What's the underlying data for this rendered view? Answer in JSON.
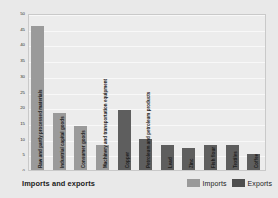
{
  "chart_data": {
    "type": "bar",
    "title": "Imports and exports",
    "xlabel": "",
    "ylabel": "Percentage of total",
    "ylim": [
      0,
      50
    ],
    "ytick_labels": [
      "50",
      "45",
      "40",
      "35",
      "30",
      "25",
      "20",
      "15",
      "10",
      "5",
      "0"
    ],
    "ytick_values": [
      50,
      45,
      40,
      35,
      30,
      25,
      20,
      15,
      10,
      5,
      0
    ],
    "grid": true,
    "legend_position": "bottom-right",
    "categories": [
      "Raw and partly processed materials",
      "Industrial capital goods",
      "Consumer goods",
      "Machinery and transportation equipment",
      "Copper",
      "Petroleum and petroleum products",
      "Lead",
      "Zinc",
      "Fish flour",
      "Textiles",
      "Coffee"
    ],
    "values": [
      46,
      18,
      14,
      8,
      19,
      10,
      8,
      7,
      8,
      8,
      5
    ],
    "series_of_point": [
      "Imports",
      "Imports",
      "Imports",
      "Imports",
      "Exports",
      "Exports",
      "Exports",
      "Exports",
      "Exports",
      "Exports",
      "Exports"
    ],
    "legend": [
      {
        "name": "Imports",
        "color": "#9a9a9a"
      },
      {
        "name": "Exports",
        "color": "#4e4e4e"
      }
    ]
  }
}
